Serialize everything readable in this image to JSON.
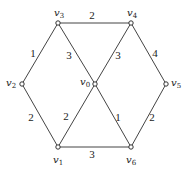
{
  "graph": {
    "nodes": [
      {
        "id": "v0",
        "label": "v",
        "sub": "0",
        "x": 95,
        "y": 84,
        "lx": 80,
        "ly": 85
      },
      {
        "id": "v1",
        "label": "v",
        "sub": "1",
        "x": 58,
        "y": 147,
        "lx": 53,
        "ly": 163
      },
      {
        "id": "v2",
        "label": "v",
        "sub": "2",
        "x": 22,
        "y": 84,
        "lx": 6,
        "ly": 86
      },
      {
        "id": "v3",
        "label": "v",
        "sub": "3",
        "x": 58,
        "y": 23,
        "lx": 54,
        "ly": 16
      },
      {
        "id": "v4",
        "label": "v",
        "sub": "4",
        "x": 131,
        "y": 23,
        "lx": 127,
        "ly": 16
      },
      {
        "id": "v5",
        "label": "v",
        "sub": "5",
        "x": 166,
        "y": 84,
        "lx": 171,
        "ly": 86
      },
      {
        "id": "v6",
        "label": "v",
        "sub": "6",
        "x": 131,
        "y": 147,
        "lx": 126,
        "ly": 163
      }
    ],
    "edges": [
      {
        "from": "v3",
        "to": "v4",
        "weight": "2",
        "lx": 92,
        "ly": 19
      },
      {
        "from": "v3",
        "to": "v2",
        "weight": "1",
        "lx": 33,
        "ly": 57
      },
      {
        "from": "v3",
        "to": "v0",
        "weight": "3",
        "lx": 69,
        "ly": 59
      },
      {
        "from": "v4",
        "to": "v0",
        "weight": "3",
        "lx": 118,
        "ly": 59
      },
      {
        "from": "v4",
        "to": "v5",
        "weight": "4",
        "lx": 155,
        "ly": 57
      },
      {
        "from": "v2",
        "to": "v1",
        "weight": "2",
        "lx": 31,
        "ly": 121
      },
      {
        "from": "v0",
        "to": "v1",
        "weight": "2",
        "lx": 66,
        "ly": 120
      },
      {
        "from": "v0",
        "to": "v6",
        "weight": "1",
        "lx": 118,
        "ly": 121
      },
      {
        "from": "v5",
        "to": "v6",
        "weight": "2",
        "lx": 152,
        "ly": 121
      },
      {
        "from": "v1",
        "to": "v6",
        "weight": "3",
        "lx": 92,
        "ly": 158
      }
    ]
  }
}
